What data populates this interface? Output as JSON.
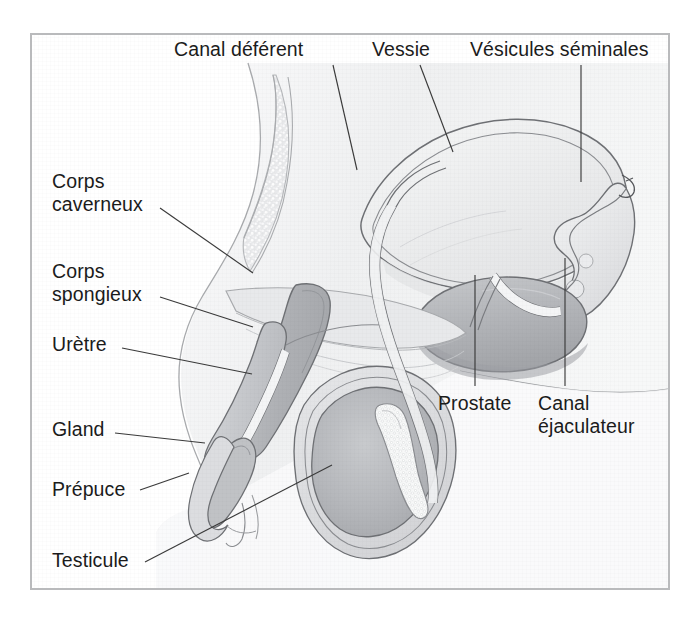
{
  "figure": {
    "language": "fr",
    "style": "grayscale medical illustration",
    "frame_color": "#b9babc",
    "background_color": "#ffffff",
    "line_color": "#3a3a3a",
    "text_color": "#1b1b1b"
  },
  "labels": [
    {
      "id": "canal-deferent",
      "text": "Canal déférent",
      "x": 174,
      "y": 38,
      "align": "left",
      "leader": {
        "x1": 333,
        "y1": 65,
        "x2": 357,
        "y2": 170
      }
    },
    {
      "id": "vessie",
      "text": "Vessie",
      "x": 372,
      "y": 38,
      "align": "left",
      "leader": {
        "x1": 420,
        "y1": 65,
        "x2": 453,
        "y2": 152
      }
    },
    {
      "id": "vesicules-seminales",
      "text": "Vésicules séminales",
      "x": 470,
      "y": 38,
      "align": "left",
      "leader": {
        "x1": 581,
        "y1": 65,
        "x2": 581,
        "y2": 182
      }
    },
    {
      "id": "corps-caverneux",
      "text": "Corps\ncaverneux",
      "lines": [
        "Corps",
        "caverneux"
      ],
      "x": 52,
      "y": 172,
      "align": "left",
      "leader": {
        "x1": 160,
        "y1": 208,
        "x2": 253,
        "y2": 273
      }
    },
    {
      "id": "corps-spongieux",
      "text": "Corps\nspongieux",
      "lines": [
        "Corps",
        "spongieux"
      ],
      "x": 52,
      "y": 262,
      "align": "left",
      "leader": {
        "x1": 160,
        "y1": 297,
        "x2": 253,
        "y2": 327
      }
    },
    {
      "id": "uretre",
      "text": "Urètre",
      "x": 52,
      "y": 335,
      "align": "left",
      "leader": {
        "x1": 122,
        "y1": 348,
        "x2": 252,
        "y2": 374
      }
    },
    {
      "id": "gland",
      "text": "Gland",
      "x": 52,
      "y": 420,
      "align": "left",
      "leader": {
        "x1": 115,
        "y1": 433,
        "x2": 205,
        "y2": 443
      }
    },
    {
      "id": "prepuce",
      "text": "Prépuce",
      "x": 52,
      "y": 480,
      "align": "left",
      "leader": {
        "x1": 140,
        "y1": 490,
        "x2": 189,
        "y2": 473
      }
    },
    {
      "id": "testicule",
      "text": "Testicule",
      "x": 52,
      "y": 551,
      "align": "left",
      "leader": {
        "x1": 145,
        "y1": 562,
        "x2": 332,
        "y2": 465
      }
    },
    {
      "id": "prostate",
      "text": "Prostate",
      "x": 438,
      "y": 394,
      "align": "left",
      "leader": {
        "x1": 475,
        "y1": 275,
        "x2": 475,
        "y2": 386
      }
    },
    {
      "id": "canal-ejaculateur",
      "text": "Canal\néjaculateur",
      "lines": [
        "Canal",
        "éjaculateur"
      ],
      "x": 538,
      "y": 394,
      "align": "left",
      "leader": {
        "x1": 565,
        "y1": 258,
        "x2": 565,
        "y2": 386
      }
    }
  ],
  "structures": [
    {
      "id": "pubic-bone",
      "name": "os pubien",
      "fill": "#e3e4e6",
      "texture": "trabecular"
    },
    {
      "id": "bladder",
      "name": "vessie",
      "fill": "#eeeff0",
      "stroke": "#6e7074"
    },
    {
      "id": "seminal-vesicle",
      "name": "vésicule séminale",
      "fill": "#e0e1e3",
      "stroke": "#6e7074"
    },
    {
      "id": "prostate",
      "name": "prostate",
      "fill": "#b9bbbe",
      "stroke": "#6e7074"
    },
    {
      "id": "corpus-cavernosum",
      "name": "corps caverneux",
      "fill": "#b4b6b9",
      "stroke": "#6e7074"
    },
    {
      "id": "corpus-spongiosum",
      "name": "corps spongieux",
      "fill": "#c9cbce",
      "stroke": "#6e7074"
    },
    {
      "id": "urethra",
      "name": "urètre",
      "fill": "#f2f3f4",
      "stroke": "#6e7074"
    },
    {
      "id": "glans",
      "name": "gland",
      "fill": "#c0c2c5",
      "stroke": "#6e7074"
    },
    {
      "id": "foreskin",
      "name": "prépuce",
      "fill": "#dcdde0",
      "stroke": "#6e7074"
    },
    {
      "id": "testicle",
      "name": "testicule",
      "fill": "#b6b8bb",
      "stroke": "#6e7074"
    },
    {
      "id": "epididymis",
      "name": "épididyme",
      "fill": "#f4f5f6",
      "stroke": "#8a8c90"
    },
    {
      "id": "vas-deferens",
      "name": "canal déférent",
      "fill": "#f0f1f2",
      "stroke": "#6e7074"
    },
    {
      "id": "body-tissue",
      "name": "tissu pelvien",
      "fill": "#f0f1f2",
      "stroke": "#9a9c9f"
    }
  ]
}
